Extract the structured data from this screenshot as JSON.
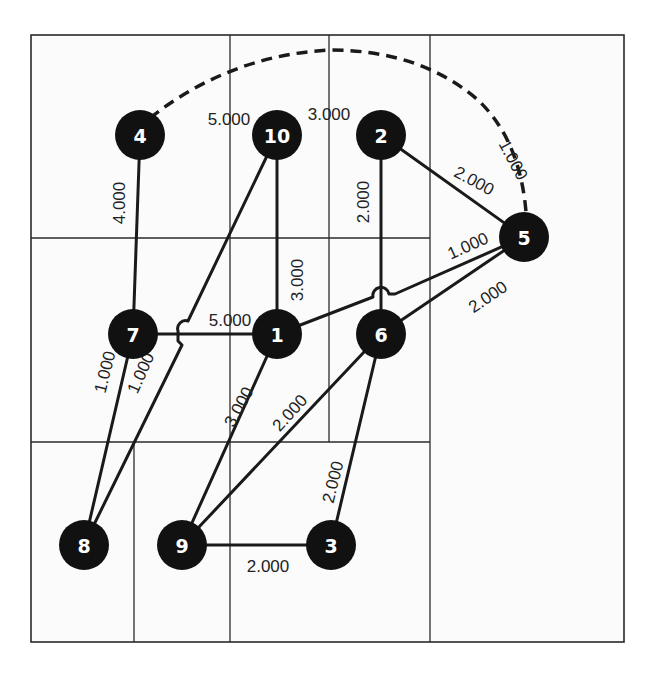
{
  "diagram": {
    "type": "weighted-graph",
    "grid": {
      "frame": {
        "x": 31,
        "y": 35,
        "w": 593,
        "h": 607
      },
      "lines": [
        {
          "x1": 31,
          "y1": 238,
          "x2": 430,
          "y2": 238
        },
        {
          "x1": 31,
          "y1": 442,
          "x2": 430,
          "y2": 442
        },
        {
          "x1": 230,
          "y1": 35,
          "x2": 230,
          "y2": 642
        },
        {
          "x1": 329,
          "y1": 35,
          "x2": 329,
          "y2": 442
        },
        {
          "x1": 430,
          "y1": 35,
          "x2": 430,
          "y2": 642
        },
        {
          "x1": 134,
          "y1": 442,
          "x2": 134,
          "y2": 642
        }
      ]
    },
    "nodes": [
      {
        "id": "1",
        "label": "1",
        "x": 277,
        "y": 334
      },
      {
        "id": "2",
        "label": "2",
        "x": 381,
        "y": 135
      },
      {
        "id": "3",
        "label": "3",
        "x": 331,
        "y": 545
      },
      {
        "id": "4",
        "label": "4",
        "x": 140,
        "y": 135
      },
      {
        "id": "5",
        "label": "5",
        "x": 524,
        "y": 237
      },
      {
        "id": "6",
        "label": "6",
        "x": 381,
        "y": 334
      },
      {
        "id": "7",
        "label": "7",
        "x": 133,
        "y": 334
      },
      {
        "id": "8",
        "label": "8",
        "x": 84,
        "y": 545
      },
      {
        "id": "9",
        "label": "9",
        "x": 182,
        "y": 545
      },
      {
        "id": "10",
        "label": "10",
        "x": 277,
        "y": 135
      }
    ],
    "edges": [
      {
        "from": "4",
        "to": "7",
        "weight": "4.000",
        "style": "solid"
      },
      {
        "from": "10",
        "to": "1",
        "weight": "3.000",
        "style": "solid"
      },
      {
        "from": "10",
        "to": "8",
        "weight": "1.000",
        "style": "solid",
        "hops": [
          "7-1"
        ]
      },
      {
        "from": "2",
        "to": "6",
        "weight": "2.000",
        "style": "solid"
      },
      {
        "from": "2",
        "to": "5",
        "weight": "2.000",
        "style": "solid"
      },
      {
        "from": "4",
        "to": "5",
        "weight": "1.000",
        "style": "dashed"
      },
      {
        "from": "1",
        "to": "5",
        "weight": "1.000",
        "style": "solid",
        "hops": [
          "2-6"
        ]
      },
      {
        "from": "6",
        "to": "5",
        "weight": "2.000",
        "style": "solid"
      },
      {
        "from": "7",
        "to": "1",
        "weight": "5.000",
        "style": "solid"
      },
      {
        "from": "7",
        "to": "8",
        "weight": "1.000",
        "style": "solid"
      },
      {
        "from": "1",
        "to": "9",
        "weight": "3.000",
        "style": "solid"
      },
      {
        "from": "6",
        "to": "9",
        "weight": "2.000",
        "style": "solid"
      },
      {
        "from": "6",
        "to": "3",
        "weight": "2.000",
        "style": "solid"
      },
      {
        "from": "9",
        "to": "3",
        "weight": "2.000",
        "style": "solid"
      }
    ],
    "labels": [
      {
        "text": "5.000",
        "x": 229,
        "y": 119,
        "rotate": 0
      },
      {
        "text": "3.000",
        "x": 329,
        "y": 114,
        "rotate": 0
      },
      {
        "text": "1.000",
        "x": 513,
        "y": 160,
        "rotate": 62
      },
      {
        "text": "2.000",
        "x": 474,
        "y": 181,
        "rotate": 28
      },
      {
        "text": "4.000",
        "x": 119,
        "y": 203,
        "rotate": -90
      },
      {
        "text": "2.000",
        "x": 363,
        "y": 202,
        "rotate": -90
      },
      {
        "text": "3.000",
        "x": 297,
        "y": 280,
        "rotate": -90
      },
      {
        "text": "1.000",
        "x": 468,
        "y": 246,
        "rotate": -24
      },
      {
        "text": "2.000",
        "x": 488,
        "y": 297,
        "rotate": -34
      },
      {
        "text": "5.000",
        "x": 230,
        "y": 320,
        "rotate": 0
      },
      {
        "text": "1.000",
        "x": 105,
        "y": 372,
        "rotate": -76
      },
      {
        "text": "1.000",
        "x": 141,
        "y": 373,
        "rotate": -66
      },
      {
        "text": "3.000",
        "x": 239,
        "y": 407,
        "rotate": -62
      },
      {
        "text": "2.000",
        "x": 290,
        "y": 413,
        "rotate": -48
      },
      {
        "text": "2.000",
        "x": 333,
        "y": 482,
        "rotate": -76
      },
      {
        "text": "2.000",
        "x": 268,
        "y": 566,
        "rotate": 0
      }
    ]
  }
}
